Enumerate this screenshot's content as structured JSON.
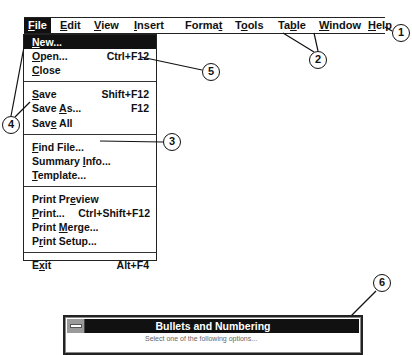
{
  "menubar": {
    "items": [
      {
        "label": "File",
        "mnemonic_index": 0,
        "active": true
      },
      {
        "label": "Edit",
        "mnemonic_index": 0
      },
      {
        "label": "View",
        "mnemonic_index": 0
      },
      {
        "label": "Insert",
        "mnemonic_index": 0
      },
      {
        "label": "Format",
        "mnemonic_index": 5
      },
      {
        "label": "Tools",
        "mnemonic_index": 1
      },
      {
        "label": "Table",
        "mnemonic_index": 2
      },
      {
        "label": "Window",
        "mnemonic_index": 0
      },
      {
        "label": "Help",
        "mnemonic_index": 0
      }
    ]
  },
  "file_menu": {
    "groups": [
      [
        {
          "label": "New...",
          "shortcut": "",
          "mnemonic_index": 0,
          "active": true
        },
        {
          "label": "Open...",
          "shortcut": "Ctrl+F12",
          "mnemonic_index": 0
        },
        {
          "label": "Close",
          "shortcut": "",
          "mnemonic_index": 0
        }
      ],
      [
        {
          "label": "Save",
          "shortcut": "Shift+F12",
          "mnemonic_index": 0
        },
        {
          "label": "Save As...",
          "shortcut": "F12",
          "mnemonic_index": 5
        },
        {
          "label": "Save All",
          "shortcut": "",
          "mnemonic_index": 3
        }
      ],
      [
        {
          "label": "Find File...",
          "shortcut": "",
          "mnemonic_index": 0
        },
        {
          "label": "Summary Info...",
          "shortcut": "",
          "mnemonic_index": 8
        },
        {
          "label": "Template...",
          "shortcut": "",
          "mnemonic_index": 0
        }
      ],
      [
        {
          "label": "Print Preview",
          "shortcut": "",
          "mnemonic_index": 8
        },
        {
          "label": "Print...",
          "shortcut": "Ctrl+Shift+F12",
          "mnemonic_index": 0
        },
        {
          "label": "Print Merge...",
          "shortcut": "",
          "mnemonic_index": 6
        },
        {
          "label": "Print Setup...",
          "shortcut": "",
          "mnemonic_index": 1
        }
      ],
      [
        {
          "label": "Exit",
          "shortcut": "Alt+F4",
          "mnemonic_index": 1
        }
      ]
    ]
  },
  "callouts": [
    "1",
    "2",
    "3",
    "4",
    "5",
    "6"
  ],
  "dialog": {
    "title": "Bullets and Numbering",
    "body_text": "Select one of the following options..."
  }
}
